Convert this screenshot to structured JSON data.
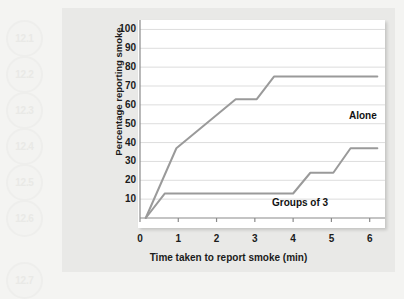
{
  "badges": [
    {
      "label": "12.1",
      "top": 20
    },
    {
      "label": "12.2",
      "top": 56
    },
    {
      "label": "12.3",
      "top": 92
    },
    {
      "label": "12.4",
      "top": 128
    },
    {
      "label": "12.5",
      "top": 164
    },
    {
      "label": "12.6",
      "top": 200
    },
    {
      "label": "12.7",
      "top": 262
    }
  ],
  "chart_data": {
    "type": "line",
    "title": "",
    "xlabel": "Time taken to report smoke (min)",
    "ylabel": "Percentage reporting smoke",
    "xlim": [
      0,
      6.4
    ],
    "ylim": [
      0,
      105
    ],
    "xticks": [
      0,
      1,
      2,
      3,
      4,
      5,
      6
    ],
    "xtick_labels": [
      "0",
      "1",
      "2",
      "3",
      "4",
      "5",
      "6"
    ],
    "yticks": [
      10,
      20,
      30,
      40,
      50,
      60,
      70,
      80,
      90,
      100
    ],
    "ytick_labels": [
      "10",
      "20",
      "30",
      "40",
      "50",
      "60",
      "70",
      "80",
      "90",
      "100"
    ],
    "grid": "horizontal",
    "legend_position": "inline-annotation",
    "line_color": "#9a9a9a",
    "grid_color": "#dddddd",
    "axis_color": "#8a8a8a",
    "series": [
      {
        "name": "Alone",
        "label": "Alone",
        "x": [
          0.15,
          0.95,
          2.5,
          3.05,
          3.5,
          6.2
        ],
        "values": [
          0,
          37,
          63,
          63,
          75,
          75
        ]
      },
      {
        "name": "Groups of 3",
        "label": "Groups of 3",
        "x": [
          0.15,
          0.65,
          4.0,
          4.45,
          5.05,
          5.5,
          6.2
        ],
        "values": [
          0,
          13,
          13,
          24,
          24,
          37,
          37
        ]
      }
    ]
  }
}
